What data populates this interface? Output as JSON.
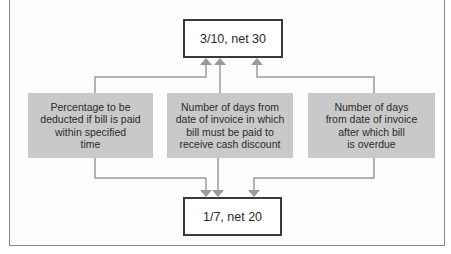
{
  "diagram": {
    "top_term": {
      "label": "3/10, net 30"
    },
    "bottom_term": {
      "label": "1/7, net 20"
    },
    "explanations": [
      {
        "id": "percentage",
        "label": "Percentage to be\ndeducted if bill is paid\nwithin specified\ntime"
      },
      {
        "id": "discount-days",
        "label": "Number of days from\ndate of invoice in which\nbill must be paid to\nreceive cash discount"
      },
      {
        "id": "net-days",
        "label": "Number of days\nfrom date of invoice\nafter which bill\nis overdue"
      }
    ],
    "colors": {
      "explanation_fill": "#c9c9c9",
      "term_border": "#3a3a3a",
      "connector": "#9a9a9a",
      "frame_border": "#8a8a8a"
    }
  }
}
